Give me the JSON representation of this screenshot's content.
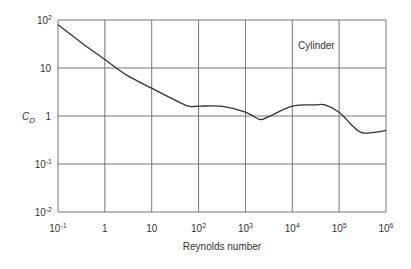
{
  "chart_data": {
    "type": "line",
    "title": "",
    "annotation": "Cylinder",
    "xlabel": "Reynolds number",
    "ylabel": "C_D",
    "xscale": "log",
    "yscale": "log",
    "xlim": [
      0.1,
      1000000
    ],
    "ylim": [
      0.01,
      100
    ],
    "grid": true,
    "legend": null,
    "x_ticks": [
      {
        "base": "10",
        "exp": "-1"
      },
      {
        "base": "1",
        "exp": ""
      },
      {
        "base": "10",
        "exp": ""
      },
      {
        "base": "10",
        "exp": "2"
      },
      {
        "base": "10",
        "exp": "3"
      },
      {
        "base": "10",
        "exp": "4"
      },
      {
        "base": "10",
        "exp": "5"
      },
      {
        "base": "10",
        "exp": "6"
      }
    ],
    "y_ticks": [
      {
        "base": "10",
        "exp": "2"
      },
      {
        "base": "10",
        "exp": ""
      },
      {
        "base": "1",
        "exp": ""
      },
      {
        "base": "10",
        "exp": "-1"
      },
      {
        "base": "10",
        "exp": "-2"
      }
    ],
    "series": [
      {
        "name": "Cylinder",
        "x": [
          0.1,
          0.3,
          1,
          3,
          10,
          30,
          60,
          100,
          300,
          1000,
          2000,
          3000,
          10000,
          30000,
          50000,
          100000,
          200000,
          300000,
          500000,
          1000000
        ],
        "values": [
          80,
          35,
          15,
          7,
          3.8,
          2.2,
          1.6,
          1.6,
          1.6,
          1.2,
          0.85,
          0.95,
          1.6,
          1.7,
          1.7,
          1.2,
          0.6,
          0.45,
          0.45,
          0.5
        ]
      }
    ]
  }
}
